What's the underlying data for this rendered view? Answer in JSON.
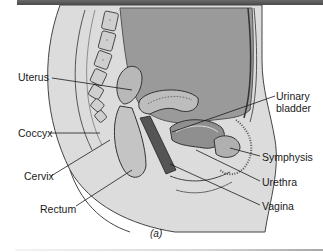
{
  "figure": {
    "caption": "(a)",
    "labels": {
      "uterus": "Uterus",
      "coccyx": "Coccyx",
      "cervix": "Cervix",
      "rectum": "Rectum",
      "urinary_bladder_line1": "Urinary",
      "urinary_bladder_line2": "bladder",
      "symphysis": "Symphysis",
      "urethra": "Urethra",
      "vagina": "Vagina"
    }
  },
  "colors": {
    "band": "#555555",
    "abdomen_fill": "#9a9a9a",
    "tissue_fill": "#c8c8c8",
    "line": "#1a1a1a",
    "text": "#1a1a1a"
  }
}
